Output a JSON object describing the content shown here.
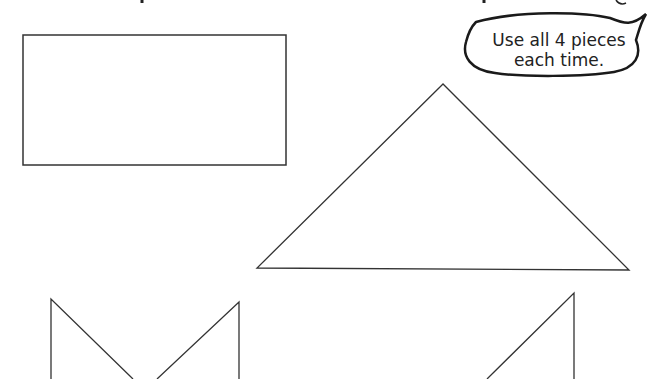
{
  "speech_bubble": {
    "line1": "Use all 4 pieces",
    "line2": "each time."
  },
  "pieces": {
    "count": 4,
    "rectangle": {
      "x": 23,
      "y": 35,
      "width": 263,
      "height": 130
    },
    "large_triangle": {
      "apex": [
        443,
        84
      ],
      "left": [
        257,
        268
      ],
      "right": [
        629,
        270
      ]
    },
    "left_notched_piece": {
      "left_x": 51,
      "left_top": 299,
      "right_x": 239,
      "right_top": 302
    },
    "right_triangle_piece": {
      "vertical_x": 574,
      "top": 293
    }
  },
  "colors": {
    "stroke": "#333333",
    "bubble_stroke": "#1a1a1a",
    "text": "#222222",
    "background": "#ffffff"
  }
}
